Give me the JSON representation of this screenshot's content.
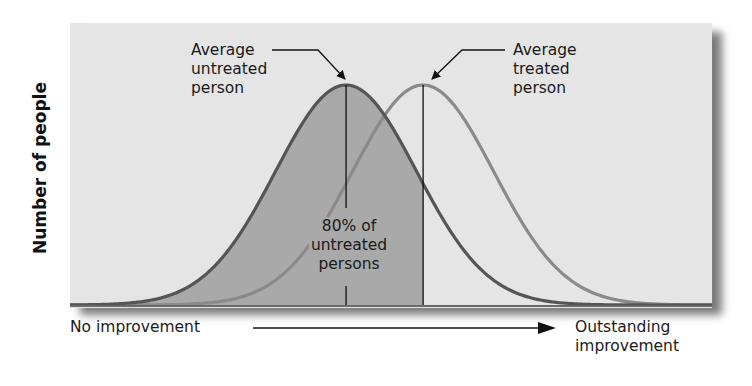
{
  "chart_data": {
    "type": "area",
    "title": "",
    "xlabel_left": "No improvement",
    "xlabel_right": [
      "Outstanding",
      "improvement"
    ],
    "ylabel": "Number of people",
    "grid": false,
    "legend": "none",
    "x_range": [
      0,
      100
    ],
    "series": [
      {
        "name": "Untreated",
        "distribution": "normal",
        "mean": 43,
        "sd": 11,
        "color": "#555555"
      },
      {
        "name": "Treated",
        "distribution": "normal",
        "mean": 55,
        "sd": 11,
        "color": "#8a8a8a"
      }
    ],
    "shaded_region": {
      "under": "Untreated",
      "from": 0,
      "to": 55,
      "color": "#a9a9a9",
      "label": "80% of untreated persons"
    },
    "annotations": [
      {
        "text": [
          "Average",
          "untreated",
          "person"
        ],
        "points_to": "Untreated peak"
      },
      {
        "text": [
          "Average",
          "treated",
          "person"
        ],
        "points_to": "Treated peak"
      },
      {
        "text": [
          "80%",
          "of",
          "untreated",
          "persons"
        ],
        "region": "shaded area"
      }
    ]
  },
  "labels": {
    "ylabel": "Number of people",
    "untreated": [
      "Average",
      "untreated",
      "person"
    ],
    "treated": [
      "Average",
      "treated",
      "person"
    ],
    "pct": [
      "80% of",
      "untreated",
      "persons"
    ],
    "x_left": "No improvement",
    "x_right": [
      "Outstanding",
      "improvement"
    ]
  },
  "colors": {
    "background": "#e5e5e5",
    "shade": "#a9a9a9",
    "untreated_curve": "#555555",
    "treated_curve": "#8a8a8a"
  }
}
